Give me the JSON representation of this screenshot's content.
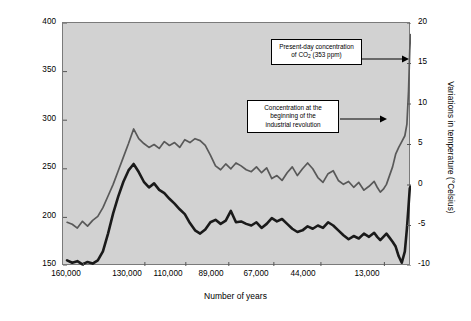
{
  "chart_data": {
    "type": "line",
    "title": "",
    "xlabel": "Number of years",
    "ylabel": "Atmospheric concentration of carbon dioxide gas (in ppm)",
    "y2label": "Variations in temperature (°Celsius)",
    "xlim": [
      170000,
      0
    ],
    "ylim": [
      150,
      400
    ],
    "y2lim": [
      -10,
      20
    ],
    "grid": false,
    "legend": "none",
    "x_tick_labels": [
      "160,000",
      "130,000",
      "110,000",
      "89,000",
      "67,000",
      "44,000",
      "13,000"
    ],
    "x_tick_values": [
      160000,
      130000,
      110000,
      89000,
      67000,
      44000,
      13000
    ],
    "y_tick_labels": [
      "150",
      "200",
      "250",
      "300",
      "350",
      "400"
    ],
    "y_tick_values": [
      150,
      200,
      250,
      300,
      350,
      400
    ],
    "y2_tick_labels": [
      "-10",
      "-5",
      "0",
      "5",
      "10",
      "15",
      "20"
    ],
    "y2_tick_values": [
      -10,
      -5,
      0,
      5,
      10,
      15,
      20
    ],
    "series": [
      {
        "name": "Atmospheric CO2 concentration",
        "axis": "left",
        "color": "#595959",
        "width": 1.7,
        "x": [
          168000,
          165500,
          163000,
          160500,
          158000,
          155500,
          153000,
          150500,
          148000,
          145500,
          143000,
          140500,
          138000,
          135500,
          133000,
          130500,
          128000,
          125500,
          123000,
          120500,
          118000,
          115500,
          113000,
          110500,
          108000,
          105500,
          103000,
          100500,
          98000,
          95500,
          93000,
          90500,
          88000,
          85500,
          83000,
          80500,
          78000,
          75500,
          73000,
          70500,
          68000,
          65500,
          63000,
          60500,
          58000,
          55500,
          53000,
          50500,
          48000,
          45500,
          43000,
          40500,
          38000,
          35500,
          33000,
          30500,
          28000,
          25500,
          23000,
          20500,
          18000,
          16500,
          15000,
          13500,
          12000,
          10500,
          9000,
          7500,
          6000,
          4500,
          3000,
          2000,
          1200,
          600,
          200
        ],
        "y": [
          195,
          193,
          189,
          196,
          191,
          197,
          201,
          210,
          222,
          234,
          248,
          262,
          276,
          291,
          281,
          276,
          272,
          275,
          271,
          278,
          274,
          277,
          272,
          280,
          277,
          281,
          279,
          274,
          264,
          253,
          249,
          255,
          250,
          256,
          253,
          249,
          247,
          252,
          246,
          251,
          240,
          243,
          238,
          246,
          252,
          243,
          250,
          256,
          250,
          241,
          236,
          245,
          248,
          238,
          234,
          237,
          231,
          236,
          228,
          232,
          237,
          231,
          226,
          229,
          234,
          243,
          252,
          265,
          272,
          278,
          284,
          296,
          330,
          372,
          388
        ]
      },
      {
        "name": "Variations in temperature",
        "axis": "right",
        "color": "#1a1a1a",
        "width": 2.6,
        "x": [
          168000,
          165500,
          163000,
          160500,
          158000,
          155500,
          153000,
          150500,
          148000,
          145500,
          143000,
          140500,
          138000,
          135500,
          133000,
          130500,
          128000,
          125500,
          123000,
          120500,
          118000,
          115500,
          113000,
          110500,
          108000,
          105500,
          103000,
          100500,
          98000,
          95500,
          93000,
          90500,
          88000,
          85500,
          83000,
          80500,
          78000,
          75500,
          73000,
          70500,
          68000,
          65500,
          63000,
          60500,
          58000,
          55500,
          53000,
          50500,
          48000,
          45500,
          43000,
          40500,
          38000,
          35500,
          33000,
          30500,
          28000,
          25500,
          23000,
          20500,
          18000,
          16500,
          15000,
          13500,
          12000,
          10500,
          9000,
          7500,
          6000,
          4500,
          3000,
          2000,
          1200,
          600,
          200
        ],
        "y": [
          -9.3,
          -9.6,
          -9.4,
          -9.8,
          -9.5,
          -9.7,
          -9.3,
          -8.2,
          -6.0,
          -3.5,
          -1.4,
          0.4,
          1.8,
          2.6,
          1.6,
          0.4,
          -0.3,
          0.2,
          -0.6,
          -1.0,
          -1.7,
          -2.3,
          -3.0,
          -3.6,
          -4.7,
          -5.6,
          -6.0,
          -5.5,
          -4.6,
          -4.3,
          -4.8,
          -4.4,
          -3.2,
          -4.6,
          -4.5,
          -4.8,
          -5.0,
          -4.6,
          -5.3,
          -4.8,
          -4.1,
          -4.5,
          -4.2,
          -4.8,
          -5.4,
          -5.8,
          -5.6,
          -5.1,
          -5.4,
          -5.0,
          -5.3,
          -4.6,
          -5.0,
          -5.6,
          -6.2,
          -6.7,
          -6.3,
          -6.6,
          -6.0,
          -6.4,
          -5.9,
          -6.4,
          -6.8,
          -6.4,
          -6.0,
          -6.5,
          -7.0,
          -7.6,
          -8.8,
          -9.6,
          -8.2,
          -5.4,
          -2.6,
          -0.4,
          -0.2
        ]
      }
    ],
    "annotations": [
      {
        "id": "present-day",
        "text_line1": "Present-day concentration",
        "text_line2_pre": "of CO",
        "text_line2_sub": "2",
        "text_line2_post": " (353 ppm)",
        "target_value_ppm": 353
      },
      {
        "id": "industrial-revolution",
        "text_line1": "Concentration at the",
        "text_line2": "beginning of the",
        "text_line3": "industrial revolution"
      }
    ]
  },
  "colors": {
    "plot_background": "#d2d2d2",
    "page_background": "#ffffff",
    "frame": "#7a7a7a",
    "co2_line": "#595959",
    "temperature_line": "#1a1a1a",
    "callout_background": "#ffffff",
    "callout_border": "#000000"
  }
}
